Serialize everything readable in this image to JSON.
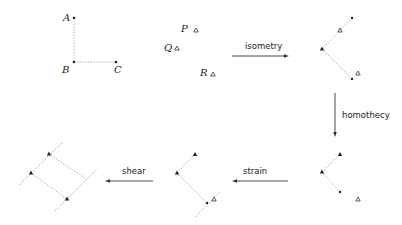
{
  "diagram": {
    "original": {
      "points": [
        {
          "label": "A",
          "x": 74,
          "y": 18
        },
        {
          "label": "B",
          "x": 74,
          "y": 62
        },
        {
          "label": "C",
          "x": 116,
          "y": 62
        }
      ],
      "triangles": [
        {
          "label": "P",
          "x": 196,
          "y": 30
        },
        {
          "label": "Q",
          "x": 177,
          "y": 48
        },
        {
          "label": "R",
          "x": 213,
          "y": 74
        }
      ]
    },
    "transformations": [
      {
        "name": "isometry",
        "direction": "right"
      },
      {
        "name": "homothecy",
        "direction": "down"
      },
      {
        "name": "strain",
        "direction": "left"
      },
      {
        "name": "shear",
        "direction": "left"
      }
    ],
    "labels": {
      "A": "A",
      "B": "B",
      "C": "C",
      "P": "P",
      "Q": "Q",
      "R": "R",
      "isometry": "isometry",
      "homothecy": "homothecy",
      "strain": "strain",
      "shear": "shear"
    }
  }
}
